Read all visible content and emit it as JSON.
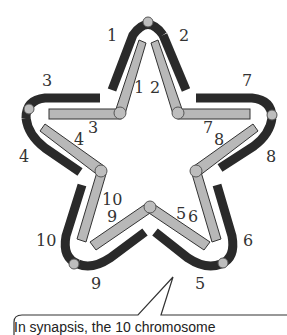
{
  "diagram": {
    "colors": {
      "outer_chromosome": "#2a2a2a",
      "inner_chromosome": "#b8b8b8",
      "inner_chromosome_border": "#333333",
      "centromere": "#bdbdbd",
      "label": "#333333"
    },
    "outer_labels": [
      "1",
      "2",
      "3",
      "4",
      "5",
      "6",
      "7",
      "8",
      "9",
      "10"
    ],
    "inner_labels": [
      "1",
      "2",
      "3",
      "4",
      "5",
      "6",
      "7",
      "8",
      "9",
      "10"
    ],
    "labels": {
      "outer": {
        "l1": "1",
        "l2": "2",
        "l3": "3",
        "l4": "4",
        "l5": "5",
        "l6": "6",
        "l7": "7",
        "l8": "8",
        "l9": "9",
        "l10": "10"
      },
      "inner": {
        "l1": "1",
        "l2": "2",
        "l3": "3",
        "l4": "4",
        "l5": "5",
        "l6": "6",
        "l7": "7",
        "l8": "8",
        "l9": "9",
        "l10": "10"
      }
    }
  },
  "callout": {
    "text": "In synapsis, the 10 chromosome"
  }
}
